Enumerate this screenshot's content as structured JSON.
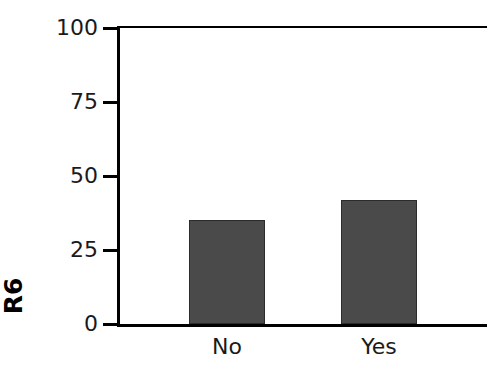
{
  "chart_data": {
    "type": "bar",
    "title": "",
    "subtitle": "",
    "xlabel": "",
    "ylabel": "R6",
    "categories": [
      "No",
      "Yes"
    ],
    "values": [
      35,
      42
    ],
    "series": [
      {
        "name": "R6",
        "values": [
          35,
          42
        ]
      }
    ],
    "ylim": [
      0,
      100
    ],
    "yticks": [
      0,
      25,
      50,
      75,
      100
    ],
    "ytick_labels": [
      "0",
      "25",
      "50",
      "75",
      "100"
    ],
    "xtick_labels": [
      "No",
      "Yes"
    ],
    "grid": false,
    "legend": "none",
    "bar_color": "#4a4a4a",
    "bar_edge_color": "#2b2b2b",
    "axis_color": "#000000",
    "background_color": "#ffffff",
    "note": "right edge of plot area is cropped by the image boundary"
  }
}
